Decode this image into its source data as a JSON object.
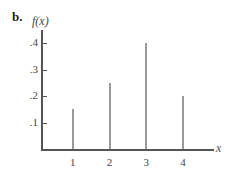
{
  "figure": {
    "panel_label": "b.",
    "ylabel": "f(x)",
    "xlabel": "x"
  },
  "chart_data": {
    "type": "bar",
    "subtype": "stem / probability mass function",
    "title": "",
    "panel_label": "b.",
    "xlabel": "x",
    "ylabel": "f(x)",
    "categories": [
      "1",
      "2",
      "3",
      "4"
    ],
    "x": [
      1,
      2,
      3,
      4
    ],
    "values": [
      0.15,
      0.25,
      0.4,
      0.2
    ],
    "yticks": [
      ".1",
      ".2",
      ".3",
      ".4"
    ],
    "ytick_values": [
      0.1,
      0.2,
      0.3,
      0.4
    ],
    "xticks": [
      "1",
      "2",
      "3",
      "4"
    ],
    "ylim": [
      0,
      0.45
    ],
    "xlim": [
      0,
      5
    ],
    "grid": false,
    "legend": null,
    "colors": {
      "stem": "#9a9a9a",
      "axis": "#555555"
    }
  }
}
